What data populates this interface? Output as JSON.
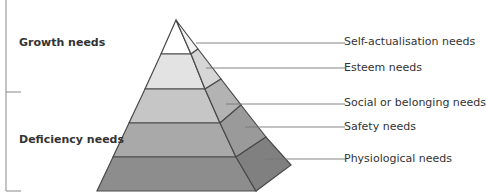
{
  "diagram": {
    "groups": [
      {
        "label": "Growth needs"
      },
      {
        "label": "Deficiency needs"
      }
    ],
    "levels": [
      {
        "label": "Self-actualisation needs",
        "front_color": "#ffffff",
        "side_color": "#f2f2f2"
      },
      {
        "label": "Esteem needs",
        "front_color": "#e3e3e3",
        "side_color": "#d6d6d6"
      },
      {
        "label": "Social or belonging needs",
        "front_color": "#c6c6c6",
        "side_color": "#b3b3b3"
      },
      {
        "label": "Safety needs",
        "front_color": "#a9a9a9",
        "side_color": "#9a9a9a"
      },
      {
        "label": "Physiological needs",
        "front_color": "#8d8d8d",
        "side_color": "#808080"
      }
    ],
    "outline_color": "#4a4a4a"
  }
}
